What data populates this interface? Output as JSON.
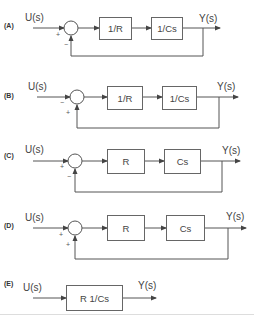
{
  "diagrams": [
    {
      "option": "(A)",
      "input": "U(s)",
      "output": "Y(s)",
      "blocks": [
        "1/R",
        "1/Cs"
      ],
      "signs": {
        "input": "+",
        "feedback": "−"
      }
    },
    {
      "option": "(B)",
      "input": "U(s)",
      "output": "Y(s)",
      "blocks": [
        "1/R",
        "1/Cs"
      ],
      "signs": {
        "input": "−",
        "feedback": "+"
      }
    },
    {
      "option": "(C)",
      "input": "U(s)",
      "output": "Y(s)",
      "blocks": [
        "R",
        "Cs"
      ],
      "signs": {
        "input": "+",
        "feedback": "−"
      }
    },
    {
      "option": "(D)",
      "input": "U(s)",
      "output": "Y(s)",
      "blocks": [
        "R",
        "Cs"
      ],
      "signs": {
        "input": "+",
        "feedback": "+"
      }
    },
    {
      "option": "(E)",
      "input": "U(s)",
      "output": "Y(s)",
      "blocks": [
        "R 1/Cs"
      ]
    }
  ],
  "colors": {
    "line": "#555555",
    "box_border": "#666666",
    "text": "#444444"
  }
}
